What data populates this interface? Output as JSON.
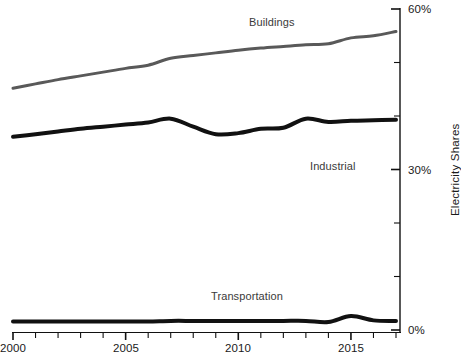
{
  "chart_data": {
    "type": "line",
    "title": "",
    "subtitle": "",
    "xlabel": "",
    "ylabel": "Electricity Shares",
    "xlim": [
      2000,
      2017
    ],
    "ylim": [
      0,
      60
    ],
    "grid": false,
    "legend_position": "inline-annotations",
    "y_tick_labels": [
      "60%",
      "30%",
      "0%"
    ],
    "y_major_ticks": [
      0,
      30,
      60
    ],
    "y_minor_ticks": [
      10,
      20,
      40,
      50
    ],
    "y_axis_side": "right",
    "x_tick_labels": [
      "2000",
      "2005",
      "2010",
      "2015"
    ],
    "x_major_ticks": [
      2000,
      2005,
      2010,
      2015
    ],
    "x_all_ticks": [
      2000,
      2001,
      2002,
      2003,
      2004,
      2005,
      2006,
      2007,
      2008,
      2009,
      2010,
      2011,
      2012,
      2013,
      2014,
      2015,
      2016,
      2017
    ],
    "x": [
      2000,
      2001,
      2002,
      2003,
      2004,
      2005,
      2006,
      2007,
      2008,
      2009,
      2010,
      2011,
      2012,
      2013,
      2014,
      2015,
      2016,
      2017
    ],
    "series": [
      {
        "name": "Buildings",
        "color": "#595959",
        "values": [
          45.2,
          46.0,
          46.8,
          47.5,
          48.2,
          48.9,
          49.5,
          50.8,
          51.3,
          51.8,
          52.3,
          52.7,
          53.0,
          53.3,
          53.5,
          54.6,
          55.0,
          55.8
        ]
      },
      {
        "name": "Industrial",
        "color": "#111111",
        "values": [
          36.1,
          36.6,
          37.1,
          37.6,
          38.0,
          38.4,
          38.8,
          39.5,
          38.0,
          36.6,
          36.8,
          37.6,
          37.8,
          39.5,
          38.9,
          39.1,
          39.2,
          39.3
        ]
      },
      {
        "name": "Transportation",
        "color": "#111111",
        "values": [
          1.6,
          1.6,
          1.6,
          1.6,
          1.6,
          1.6,
          1.6,
          1.7,
          1.7,
          1.7,
          1.7,
          1.7,
          1.7,
          1.7,
          1.5,
          2.6,
          1.8,
          1.7
        ]
      }
    ],
    "annotations": [
      {
        "text": "Buildings",
        "x": 2011.5,
        "y": 57.5
      },
      {
        "text": "Industrial",
        "x": 2014.2,
        "y": 30.6
      },
      {
        "text": "Transportation",
        "x": 2010.4,
        "y": 6.4
      }
    ]
  }
}
